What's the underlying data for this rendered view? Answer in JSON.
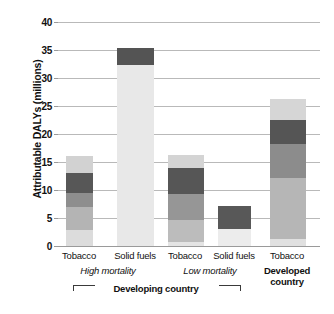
{
  "chart_data": {
    "type": "bar",
    "title": "",
    "xlabel": "",
    "ylabel": "Attributable DALYs (millions)",
    "ylim": [
      0,
      40
    ],
    "yticks": [
      "0",
      "5",
      "10",
      "15",
      "20",
      "25",
      "30",
      "35",
      "40"
    ],
    "grid": true,
    "legend": "none",
    "stacked": true,
    "categories": [
      "Tobacco",
      "Solid fuels",
      "Tobacco",
      "Solid fuels",
      "Tobacco"
    ],
    "group_labels": [
      "High mortality",
      "Low mortality",
      "Developed",
      "country"
    ],
    "bracket_label": "Developing country",
    "totals": [
      16.0,
      35.3,
      16.3,
      7.2,
      26.3
    ],
    "bars": [
      {
        "category": "Tobacco",
        "group": "Developing country, High mortality",
        "total": 16.0,
        "segments": [
          {
            "from": 0.0,
            "to": 2.9,
            "color": "#dcdcdc"
          },
          {
            "from": 2.9,
            "to": 7.0,
            "color": "#b4b4b4"
          },
          {
            "from": 7.0,
            "to": 9.5,
            "color": "#8e8e8e"
          },
          {
            "from": 9.5,
            "to": 13.1,
            "color": "#575757"
          },
          {
            "from": 13.1,
            "to": 16.0,
            "color": "#d2d2d2"
          }
        ]
      },
      {
        "category": "Solid fuels",
        "group": "Developing country, High mortality",
        "total": 35.3,
        "segments": [
          {
            "from": 0.0,
            "to": 32.3,
            "color": "#e8e8e8"
          },
          {
            "from": 32.3,
            "to": 35.3,
            "color": "#545454"
          }
        ]
      },
      {
        "category": "Tobacco",
        "group": "Developing country, Low mortality",
        "total": 16.3,
        "segments": [
          {
            "from": 0.0,
            "to": 0.8,
            "color": "#e4e4e4"
          },
          {
            "from": 0.8,
            "to": 4.7,
            "color": "#bcbcbc"
          },
          {
            "from": 4.7,
            "to": 9.2,
            "color": "#969696"
          },
          {
            "from": 9.2,
            "to": 14.0,
            "color": "#565656"
          },
          {
            "from": 14.0,
            "to": 16.3,
            "color": "#d4d4d4"
          }
        ]
      },
      {
        "category": "Solid fuels",
        "group": "Developing country, Low mortality",
        "total": 7.2,
        "segments": [
          {
            "from": 0.0,
            "to": 3.0,
            "color": "#ececec"
          },
          {
            "from": 3.0,
            "to": 7.2,
            "color": "#585858"
          }
        ]
      },
      {
        "category": "Tobacco",
        "group": "Developed country",
        "total": 26.3,
        "segments": [
          {
            "from": 0.0,
            "to": 1.2,
            "color": "#e0e0e0"
          },
          {
            "from": 1.2,
            "to": 12.2,
            "color": "#b6b6b6"
          },
          {
            "from": 12.2,
            "to": 18.3,
            "color": "#8c8c8c"
          },
          {
            "from": 18.3,
            "to": 22.5,
            "color": "#555555"
          },
          {
            "from": 22.5,
            "to": 26.3,
            "color": "#d6d6d6"
          }
        ]
      }
    ]
  },
  "axis": {
    "y_title": "Attributable DALYs (millions)"
  },
  "colors": {
    "gridline": "#b9b9b9",
    "text": "#111111",
    "background": "#ffffff"
  }
}
